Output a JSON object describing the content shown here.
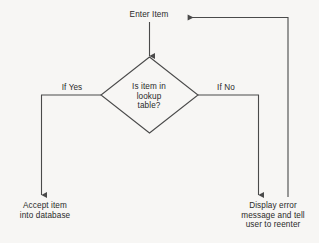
{
  "diagram": {
    "type": "flowchart",
    "background_color": "#f7f6f4",
    "line_color": "#4a4a4a",
    "text_color": "#2a2a2a",
    "nodes": {
      "start": {
        "name": "enter-item",
        "shape": "text",
        "text": "Enter Item"
      },
      "decision": {
        "name": "is-item-in-lookup-table",
        "shape": "diamond",
        "text": "Is item in\nlookup\ntable?"
      },
      "accept": {
        "name": "accept-item-into-database",
        "shape": "text",
        "text": "Accept item\ninto database"
      },
      "error": {
        "name": "display-error-message",
        "shape": "text",
        "text": "Display error\nmessage and tell\nuser to reenter"
      }
    },
    "edges": {
      "yes_label": "If Yes",
      "no_label": "If No"
    }
  }
}
